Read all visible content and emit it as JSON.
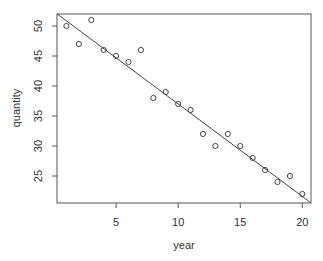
{
  "chart_data": {
    "type": "scatter",
    "title": "",
    "xlabel": "year",
    "ylabel": "quantity",
    "x_ticks": [
      5,
      10,
      15,
      20
    ],
    "y_ticks": [
      25,
      30,
      35,
      40,
      45,
      50
    ],
    "xlim": [
      0.24,
      20.7
    ],
    "ylim": [
      20.5,
      52
    ],
    "grid": false,
    "legend": null,
    "series": [
      {
        "name": "observations",
        "marker": "open-circle",
        "x": [
          1,
          2,
          3,
          4,
          5,
          6,
          7,
          8,
          9,
          10,
          11,
          12,
          13,
          14,
          15,
          16,
          17,
          18,
          19,
          20
        ],
        "y": [
          50,
          47,
          51,
          46,
          45,
          44,
          46,
          38,
          39,
          37,
          36,
          32,
          30,
          32,
          30,
          28,
          26,
          24,
          25,
          22
        ]
      }
    ],
    "fit_line": {
      "name": "regression line",
      "intercept": 52.4,
      "slope": -1.54
    }
  },
  "colors": {
    "axis": "#555555",
    "points": "#333333",
    "line": "#444444",
    "text": "#333333"
  }
}
